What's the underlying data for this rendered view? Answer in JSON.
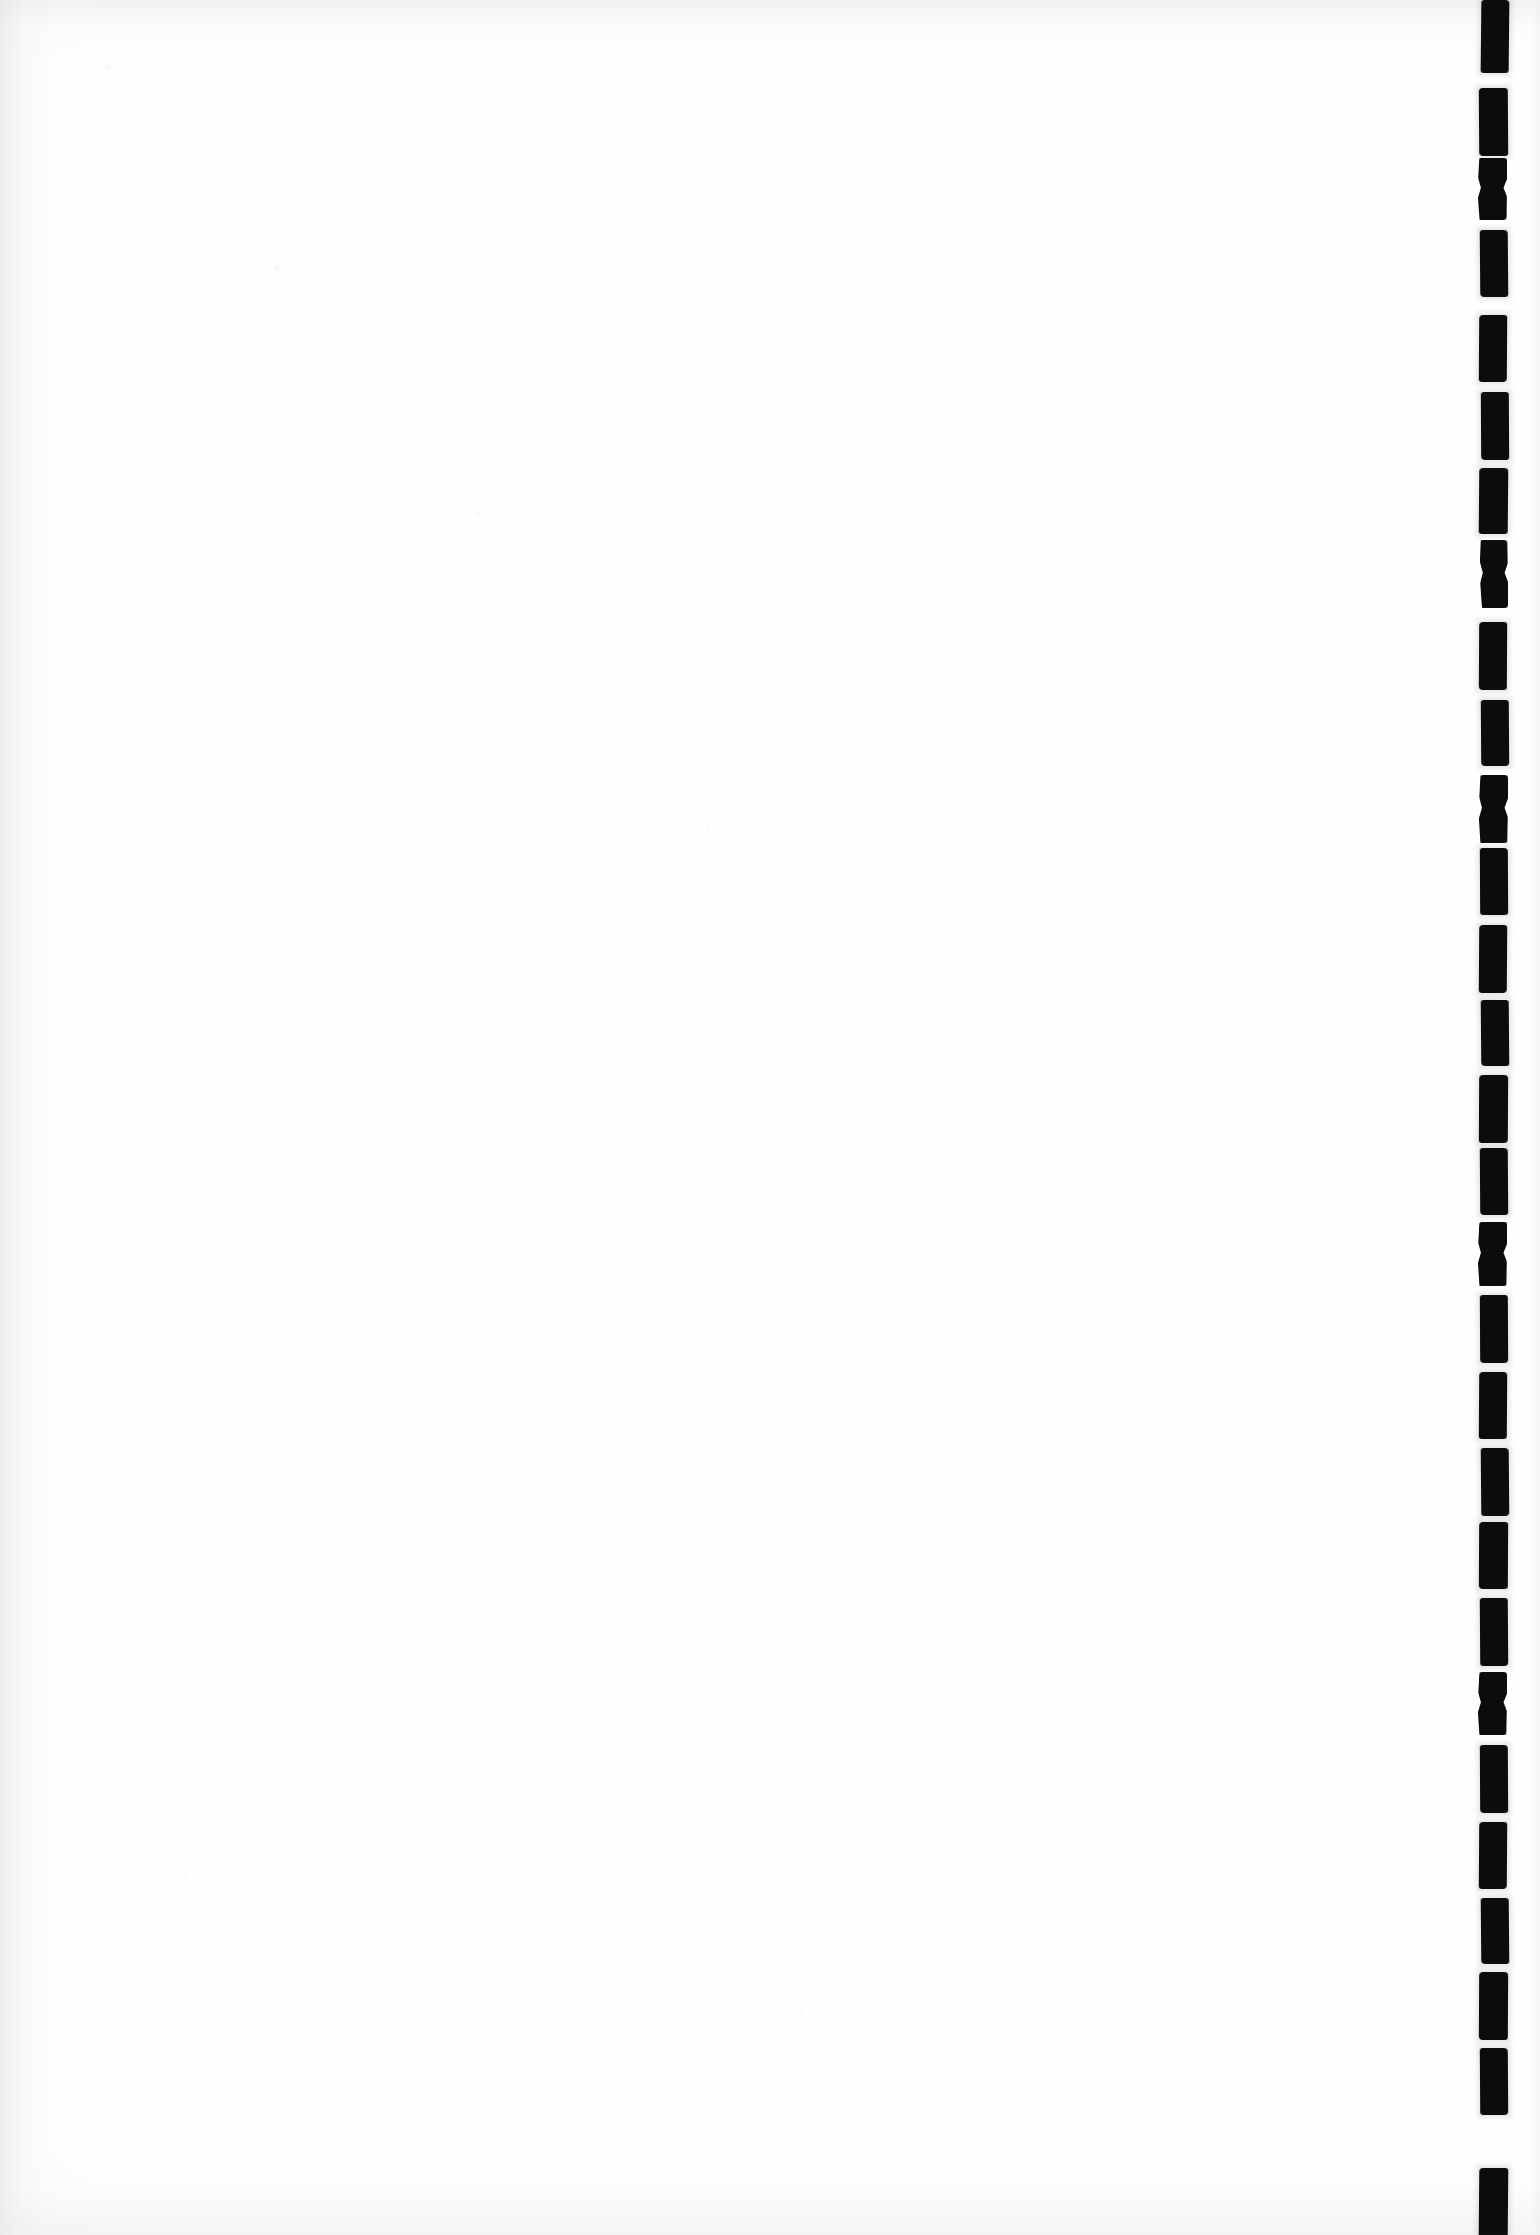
{
  "document": {
    "page_kind": "blank-scanned-page",
    "page_label": "",
    "body_text": "",
    "header_text": "",
    "footer_text": "",
    "page_number": "",
    "caption": ""
  },
  "canvas": {
    "width": 1540,
    "height": 2235,
    "paper_color": "#fefefe",
    "ink_color": "#0a0a0a",
    "grain_color": "#ececf0"
  },
  "gutter": {
    "name": "binding-edge-marks",
    "description": "column of dark rectangular binding-edge artifacts along right margin",
    "mark_color": "#0a0a0a",
    "mark_count": 21,
    "mark_width": 28,
    "mark_height": 68,
    "pitch": 106,
    "left_x": 1479,
    "marks": [
      {
        "x": 1481,
        "y": 0,
        "w": 28,
        "h": 73,
        "skew": -0.6,
        "radius": "3px 4px 3px 3px"
      },
      {
        "x": 1479,
        "y": 88,
        "w": 29,
        "h": 68,
        "skew": 0.4,
        "radius": "4px 3px 3px 4px"
      },
      {
        "x": 1478,
        "y": 158,
        "w": 29,
        "h": 62,
        "skew": -0.3,
        "radius": "3px 3px 4px 3px",
        "pinch": true
      },
      {
        "x": 1480,
        "y": 230,
        "w": 28,
        "h": 67,
        "skew": 0.5,
        "radius": "3px 4px 3px 4px"
      },
      {
        "x": 1479,
        "y": 315,
        "w": 28,
        "h": 67,
        "skew": -0.4,
        "radius": "4px 3px 4px 3px"
      },
      {
        "x": 1481,
        "y": 392,
        "w": 28,
        "h": 68,
        "skew": 0.3,
        "radius": "3px 3px 3px 4px"
      },
      {
        "x": 1479,
        "y": 468,
        "w": 29,
        "h": 66,
        "skew": -0.5,
        "radius": "4px 4px 3px 3px"
      },
      {
        "x": 1480,
        "y": 540,
        "w": 28,
        "h": 68,
        "skew": 0.6,
        "radius": "3px 4px 4px 3px",
        "pinch": true
      },
      {
        "x": 1479,
        "y": 622,
        "w": 28,
        "h": 68,
        "skew": -0.3,
        "radius": "4px 3px 3px 4px"
      },
      {
        "x": 1481,
        "y": 700,
        "w": 28,
        "h": 66,
        "skew": 0.4,
        "radius": "3px 3px 4px 4px"
      },
      {
        "x": 1479,
        "y": 775,
        "w": 29,
        "h": 68,
        "skew": -0.6,
        "radius": "4px 4px 3px 3px",
        "pinch": true
      },
      {
        "x": 1480,
        "y": 848,
        "w": 28,
        "h": 67,
        "skew": 0.3,
        "radius": "3px 4px 3px 3px"
      },
      {
        "x": 1479,
        "y": 925,
        "w": 28,
        "h": 68,
        "skew": -0.4,
        "radius": "4px 3px 4px 3px"
      },
      {
        "x": 1481,
        "y": 1000,
        "w": 28,
        "h": 66,
        "skew": 0.5,
        "radius": "3px 3px 3px 4px"
      },
      {
        "x": 1479,
        "y": 1075,
        "w": 29,
        "h": 68,
        "skew": -0.3,
        "radius": "4px 4px 4px 3px"
      },
      {
        "x": 1480,
        "y": 1148,
        "w": 28,
        "h": 67,
        "skew": 0.4,
        "radius": "3px 4px 3px 4px"
      },
      {
        "x": 1478,
        "y": 1222,
        "w": 29,
        "h": 64,
        "skew": -0.5,
        "radius": "4px 3px 3px 3px",
        "pinch": true
      },
      {
        "x": 1480,
        "y": 1295,
        "w": 28,
        "h": 68,
        "skew": 0.3,
        "radius": "3px 3px 4px 4px"
      },
      {
        "x": 1479,
        "y": 1372,
        "w": 28,
        "h": 67,
        "skew": -0.4,
        "radius": "4px 4px 3px 3px"
      },
      {
        "x": 1481,
        "y": 1448,
        "w": 28,
        "h": 68,
        "skew": 0.5,
        "radius": "3px 4px 4px 3px"
      },
      {
        "x": 1479,
        "y": 1522,
        "w": 29,
        "h": 67,
        "skew": -0.3,
        "radius": "4px 3px 3px 4px"
      },
      {
        "x": 1480,
        "y": 1598,
        "w": 28,
        "h": 68,
        "skew": 0.4,
        "radius": "3px 3px 4px 3px"
      },
      {
        "x": 1478,
        "y": 1672,
        "w": 29,
        "h": 63,
        "skew": -0.6,
        "radius": "4px 4px 3px 3px",
        "pinch": true
      },
      {
        "x": 1480,
        "y": 1745,
        "w": 28,
        "h": 68,
        "skew": 0.3,
        "radius": "3px 4px 3px 4px"
      },
      {
        "x": 1479,
        "y": 1822,
        "w": 28,
        "h": 67,
        "skew": -0.4,
        "radius": "4px 3px 4px 3px"
      },
      {
        "x": 1481,
        "y": 1898,
        "w": 28,
        "h": 66,
        "skew": 0.5,
        "radius": "3px 3px 3px 4px"
      },
      {
        "x": 1479,
        "y": 1972,
        "w": 29,
        "h": 68,
        "skew": -0.3,
        "radius": "4px 4px 3px 4px"
      },
      {
        "x": 1480,
        "y": 2048,
        "w": 28,
        "h": 67,
        "skew": 0.4,
        "radius": "3px 4px 4px 3px"
      },
      {
        "x": 1479,
        "y": 2168,
        "w": 29,
        "h": 67,
        "skew": -0.5,
        "radius": "4px 3px 0px 0px"
      }
    ]
  }
}
